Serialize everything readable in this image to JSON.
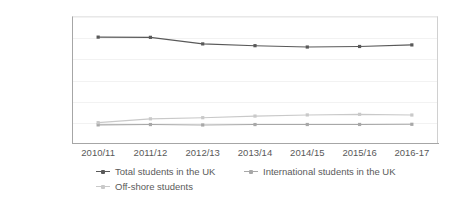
{
  "chart_data": {
    "type": "line",
    "title": "",
    "xlabel": "",
    "ylabel": "",
    "categories": [
      "2010/11",
      "2011/12",
      "2012/13",
      "2013/14",
      "2014/15",
      "2015/16",
      "2016-17"
    ],
    "ylim": [
      0,
      3000000
    ],
    "ytick_values": [
      0,
      500000,
      1000000,
      1500000,
      2000000,
      2500000,
      3000000
    ],
    "ytick_labels": [
      "0",
      "500000",
      "1000000",
      "1500000",
      "2000000",
      "2500000",
      "3000000"
    ],
    "grid": true,
    "legend_position": "bottom",
    "series": [
      {
        "name": "Total students in the UK",
        "color": "#595959",
        "values": [
          2501000,
          2496000,
          2341000,
          2299000,
          2267000,
          2280000,
          2317000
        ]
      },
      {
        "name": "International students in the UK",
        "color": "#a8a8a8",
        "values": [
          428000,
          436000,
          426000,
          436000,
          437000,
          438000,
          442000
        ]
      },
      {
        "name": "Off-shore students",
        "color": "#c9c9c9",
        "values": [
          481000,
          571000,
          598000,
          636000,
          663000,
          677000,
          661000
        ]
      }
    ]
  },
  "axis": {
    "tick_color": "#595959",
    "line_color": "#a6a6a6",
    "grid_color": "#f2f2f2"
  }
}
